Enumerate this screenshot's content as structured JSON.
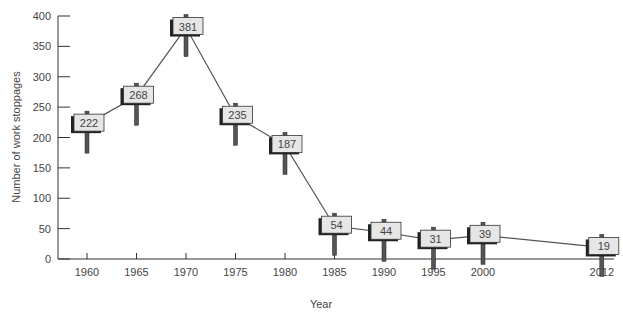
{
  "chart_data": {
    "type": "line",
    "title": "",
    "xlabel": "Year",
    "ylabel": "Number of work stoppages",
    "x": [
      1960,
      1965,
      1970,
      1975,
      1980,
      1985,
      1990,
      1995,
      2000,
      2012
    ],
    "categories": [
      "1960",
      "1965",
      "1970",
      "1975",
      "1980",
      "1985",
      "1990",
      "1995",
      "2000",
      "2012"
    ],
    "series": [
      {
        "name": "Work stoppages",
        "values": [
          222,
          268,
          381,
          235,
          187,
          54,
          44,
          31,
          39,
          19
        ]
      }
    ],
    "ylim": [
      0,
      400
    ],
    "yticks": [
      0,
      50,
      100,
      150,
      200,
      250,
      300,
      350,
      400
    ],
    "grid": false,
    "legend": null,
    "annotations": "Each data point labeled with its value on a signpost marker"
  },
  "colors": {
    "line": "#555555",
    "axis": "#333333",
    "sign_fill": "#e6e6e6",
    "sign_shadow": "#222222",
    "post": "#555555"
  }
}
